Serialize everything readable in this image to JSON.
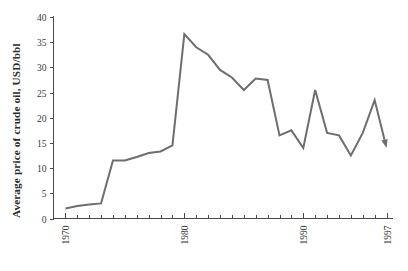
{
  "chart_data": {
    "type": "line",
    "title": "",
    "xlabel": "",
    "ylabel": "Average price of crude oil, USD/bbl",
    "xlim": [
      1969,
      1997.5
    ],
    "ylim": [
      0,
      40
    ],
    "grid": false,
    "legend": "none",
    "line_color": "#6e6e6e",
    "line_width": 2,
    "end_marker": "down-arrow",
    "y_ticks": [
      0,
      5,
      10,
      15,
      20,
      25,
      30,
      35,
      40
    ],
    "y_tick_labels": [
      "0",
      "5",
      "10",
      "15",
      "20",
      "25",
      "30",
      "35",
      "40"
    ],
    "x_ticks": [
      1970,
      1980,
      1990,
      1997
    ],
    "x_tick_labels": [
      "1970",
      "1980",
      "1990",
      "1997"
    ],
    "x_minor_tick_interval": 1,
    "x_tick_label_rotation": -90,
    "x": [
      1970,
      1971,
      1972,
      1973,
      1974,
      1975,
      1976,
      1977,
      1978,
      1979,
      1980,
      1981,
      1982,
      1983,
      1984,
      1985,
      1986,
      1987,
      1988,
      1989,
      1990,
      1991,
      1992,
      1993,
      1994,
      1995,
      1996,
      1997
    ],
    "values": [
      2.0,
      2.5,
      2.8,
      3.0,
      11.5,
      11.5,
      12.2,
      13.0,
      13.3,
      14.5,
      36.6,
      34.0,
      32.5,
      29.5,
      28.0,
      25.5,
      27.8,
      27.5,
      16.5,
      17.5,
      14.0,
      25.5,
      17.0,
      16.5,
      12.5,
      17.0,
      23.5,
      14.0
    ],
    "series": [
      {
        "name": "Average price of crude oil",
        "values": [
          2.0,
          2.5,
          2.8,
          3.0,
          11.5,
          11.5,
          12.2,
          13.0,
          13.3,
          14.5,
          36.6,
          34.0,
          32.5,
          29.5,
          28.0,
          25.5,
          27.8,
          27.5,
          16.5,
          17.5,
          14.0,
          25.5,
          17.0,
          16.5,
          12.5,
          17.0,
          23.5,
          14.0
        ]
      }
    ]
  }
}
